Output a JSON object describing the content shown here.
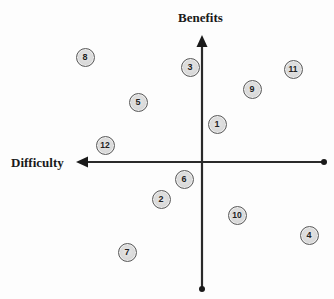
{
  "diagram": {
    "type": "quadrant-matrix",
    "y_axis": {
      "label": "Benefits",
      "direction": "up"
    },
    "x_axis": {
      "label": "Difficulty",
      "direction": "left"
    },
    "colors": {
      "axis": "#2a2a2a",
      "node_fill": "#d9d9d9",
      "node_border": "#5a5a5a",
      "text": "#1a1a1a"
    },
    "items": [
      {
        "id": "1",
        "label": "1",
        "x": 217,
        "y": 124
      },
      {
        "id": "2",
        "label": "2",
        "x": 161,
        "y": 199
      },
      {
        "id": "3",
        "label": "3",
        "x": 190,
        "y": 67
      },
      {
        "id": "4",
        "label": "4",
        "x": 309,
        "y": 235
      },
      {
        "id": "5",
        "label": "5",
        "x": 138,
        "y": 102
      },
      {
        "id": "6",
        "label": "6",
        "x": 184,
        "y": 179
      },
      {
        "id": "7",
        "label": "7",
        "x": 127,
        "y": 252
      },
      {
        "id": "8",
        "label": "8",
        "x": 85,
        "y": 57
      },
      {
        "id": "9",
        "label": "9",
        "x": 252,
        "y": 89
      },
      {
        "id": "10",
        "label": "10",
        "x": 237,
        "y": 215
      },
      {
        "id": "11",
        "label": "11",
        "x": 293,
        "y": 69
      },
      {
        "id": "12",
        "label": "12",
        "x": 105,
        "y": 145
      }
    ]
  }
}
